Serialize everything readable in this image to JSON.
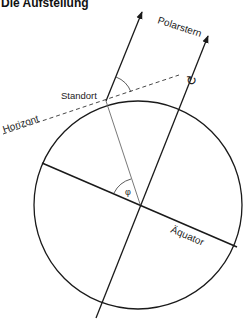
{
  "title": "Die Aufstellung",
  "labels": {
    "polarstern": "Polarstern",
    "standort": "Standort",
    "horizont": "Horizont",
    "aequator": "Äquator",
    "phi": "φ",
    "rotation": "↻"
  },
  "colors": {
    "line": "#1a1a1a",
    "thin_line": "#555555",
    "background": "#ffffff"
  }
}
